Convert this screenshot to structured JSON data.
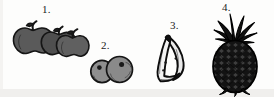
{
  "page": {
    "kind": "fruit-illustration-worksheet",
    "background_color": "#fdfdfc",
    "ink_color": "#1b1b1b",
    "width": 274,
    "height": 97
  },
  "items": [
    {
      "number": "1.",
      "name": "apples",
      "icon": "apples-icon",
      "count": 3,
      "fill_color": "#5a5a5a",
      "outline_color": "#151515",
      "label_x": 42,
      "label_y": 4,
      "art_x": 11,
      "art_y": 18
    },
    {
      "number": "2.",
      "name": "berries",
      "icon": "berries-icon",
      "count": 2,
      "fill_color": "#8c8c8c",
      "outline_color": "#151515",
      "label_x": 101,
      "label_y": 40,
      "art_x": 88,
      "art_y": 53
    },
    {
      "number": "3.",
      "name": "bananas",
      "icon": "bananas-icon",
      "count": 2,
      "fill_color": "#e9e9e9",
      "outline_color": "#0d0d0d",
      "label_x": 170,
      "label_y": 20,
      "art_x": 152,
      "art_y": 33
    },
    {
      "number": "4.",
      "name": "pineapple",
      "icon": "pineapple-icon",
      "count": 1,
      "fill_color": "#1a1a1a",
      "outline_color": "#000000",
      "label_x": 222,
      "label_y": 2,
      "art_x": 204,
      "art_y": 12
    }
  ]
}
